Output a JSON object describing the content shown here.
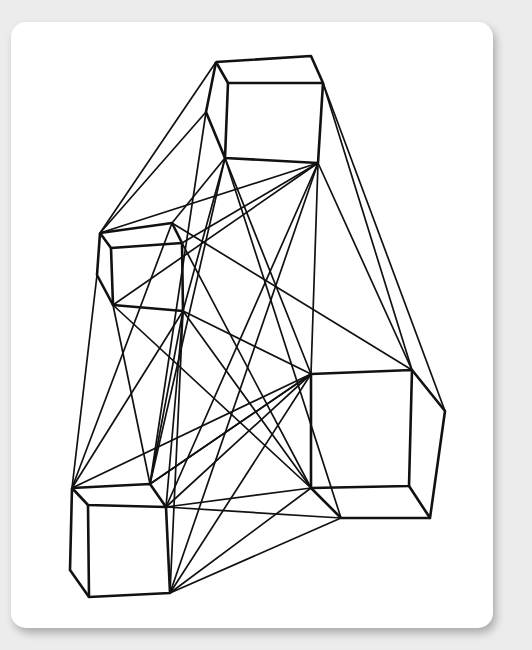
{
  "artwork": {
    "subject": "wireframe-cubes-drawing",
    "stroke_color": "#111111",
    "background_color": "#ececec",
    "card_color": "#ffffff",
    "cubes": [
      {
        "name": "top-cube",
        "polys": [
          [
            [
              216,
              62
            ],
            [
              311,
              56
            ],
            [
              323,
              83
            ],
            [
              228,
              83
            ],
            [
              216,
              62
            ]
          ],
          [
            [
              228,
              83
            ],
            [
              225,
              158
            ],
            [
              318,
              163
            ],
            [
              323,
              83
            ]
          ],
          [
            [
              216,
              62
            ],
            [
              206,
              112
            ],
            [
              225,
              158
            ]
          ]
        ]
      },
      {
        "name": "left-cube",
        "polys": [
          [
            [
              100,
              233
            ],
            [
              172,
              223
            ],
            [
              182,
              243
            ],
            [
              111,
              248
            ],
            [
              100,
              233
            ]
          ],
          [
            [
              111,
              248
            ],
            [
              113,
              305
            ],
            [
              183,
              311
            ],
            [
              182,
              243
            ]
          ],
          [
            [
              100,
              233
            ],
            [
              97,
              275
            ],
            [
              113,
              305
            ]
          ]
        ]
      },
      {
        "name": "right-cube",
        "polys": [
          [
            [
              311,
              374
            ],
            [
              412,
              370
            ],
            [
              409,
              486
            ],
            [
              311,
              488
            ],
            [
              311,
              374
            ]
          ],
          [
            [
              412,
              370
            ],
            [
              445,
              411
            ],
            [
              430,
              518
            ],
            [
              409,
              486
            ]
          ],
          [
            [
              311,
              488
            ],
            [
              341,
              518
            ],
            [
              430,
              518
            ]
          ]
        ]
      },
      {
        "name": "bottom-cube",
        "polys": [
          [
            [
              72,
              488
            ],
            [
              150,
              484
            ],
            [
              166,
              507
            ],
            [
              88,
              505
            ],
            [
              72,
              488
            ]
          ],
          [
            [
              88,
              505
            ],
            [
              89,
              597
            ],
            [
              170,
              593
            ],
            [
              166,
              507
            ]
          ],
          [
            [
              72,
              488
            ],
            [
              70,
              570
            ],
            [
              89,
              597
            ]
          ]
        ]
      }
    ],
    "edges": [
      [
        [
          206,
          112
        ],
        [
          100,
          233
        ]
      ],
      [
        [
          216,
          62
        ],
        [
          100,
          233
        ]
      ],
      [
        [
          225,
          158
        ],
        [
          172,
          223
        ]
      ],
      [
        [
          225,
          158
        ],
        [
          183,
          311
        ]
      ],
      [
        [
          318,
          163
        ],
        [
          100,
          233
        ]
      ],
      [
        [
          318,
          163
        ],
        [
          182,
          243
        ]
      ],
      [
        [
          318,
          163
        ],
        [
          113,
          305
        ]
      ],
      [
        [
          318,
          163
        ],
        [
          311,
          374
        ]
      ],
      [
        [
          318,
          163
        ],
        [
          412,
          370
        ]
      ],
      [
        [
          323,
          83
        ],
        [
          412,
          370
        ]
      ],
      [
        [
          323,
          83
        ],
        [
          445,
          411
        ]
      ],
      [
        [
          225,
          158
        ],
        [
          311,
          374
        ]
      ],
      [
        [
          225,
          158
        ],
        [
          341,
          518
        ]
      ],
      [
        [
          206,
          112
        ],
        [
          150,
          484
        ]
      ],
      [
        [
          172,
          223
        ],
        [
          412,
          370
        ]
      ],
      [
        [
          182,
          243
        ],
        [
          311,
          488
        ]
      ],
      [
        [
          183,
          311
        ],
        [
          311,
          374
        ]
      ],
      [
        [
          183,
          311
        ],
        [
          72,
          488
        ]
      ],
      [
        [
          183,
          311
        ],
        [
          150,
          484
        ]
      ],
      [
        [
          183,
          311
        ],
        [
          166,
          507
        ]
      ],
      [
        [
          183,
          311
        ],
        [
          170,
          593
        ]
      ],
      [
        [
          183,
          311
        ],
        [
          311,
          488
        ]
      ],
      [
        [
          113,
          305
        ],
        [
          150,
          484
        ]
      ],
      [
        [
          97,
          275
        ],
        [
          72,
          488
        ]
      ],
      [
        [
          113,
          305
        ],
        [
          311,
          488
        ]
      ],
      [
        [
          311,
          374
        ],
        [
          72,
          488
        ]
      ],
      [
        [
          311,
          374
        ],
        [
          150,
          484
        ]
      ],
      [
        [
          311,
          374
        ],
        [
          166,
          507
        ]
      ],
      [
        [
          311,
          374
        ],
        [
          170,
          593
        ]
      ],
      [
        [
          318,
          163
        ],
        [
          166,
          507
        ]
      ],
      [
        [
          318,
          163
        ],
        [
          170,
          593
        ]
      ],
      [
        [
          225,
          158
        ],
        [
          150,
          484
        ]
      ],
      [
        [
          166,
          507
        ],
        [
          311,
          488
        ]
      ],
      [
        [
          166,
          507
        ],
        [
          341,
          518
        ]
      ],
      [
        [
          170,
          593
        ],
        [
          311,
          488
        ]
      ],
      [
        [
          170,
          593
        ],
        [
          341,
          518
        ]
      ],
      [
        [
          150,
          484
        ],
        [
          311,
          374
        ]
      ],
      [
        [
          172,
          223
        ],
        [
          72,
          488
        ]
      ]
    ]
  }
}
